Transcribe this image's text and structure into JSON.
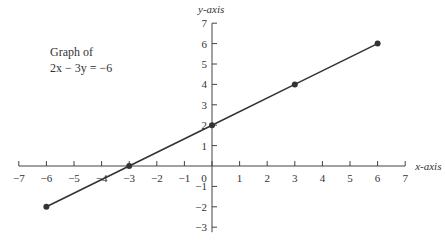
{
  "chart_data": {
    "type": "line",
    "title": "Graph of 2x − 3y = −6",
    "title_lines": [
      "Graph of",
      "2x − 3y = −6"
    ],
    "xlabel": "x-axis",
    "ylabel": "y-axis",
    "xlim": [
      -7,
      7
    ],
    "ylim": [
      -3,
      7
    ],
    "x_ticks": [
      -7,
      -6,
      -5,
      -4,
      -3,
      -2,
      -1,
      0,
      1,
      2,
      3,
      4,
      5,
      6,
      7
    ],
    "y_ticks": [
      -3,
      -2,
      -1,
      1,
      2,
      3,
      4,
      5,
      6,
      7
    ],
    "grid": false,
    "series": [
      {
        "name": "2x - 3y = -6",
        "x": [
          -6,
          -3,
          0,
          3,
          6
        ],
        "y": [
          -2,
          0,
          2,
          4,
          6
        ],
        "color": "#333333",
        "markers": true
      }
    ]
  }
}
